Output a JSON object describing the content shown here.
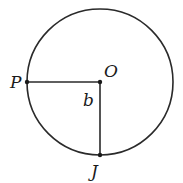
{
  "diagram": {
    "type": "geometry-circle",
    "circle": {
      "cx": 100,
      "cy": 82,
      "r": 73,
      "stroke": "#2a2a2a"
    },
    "points": [
      {
        "id": "O",
        "label": "O",
        "x": 100,
        "y": 82
      },
      {
        "id": "P",
        "label": "P",
        "x": 27,
        "y": 82
      },
      {
        "id": "J",
        "label": "J",
        "x": 100,
        "y": 155
      }
    ],
    "segments": [
      {
        "from": "P",
        "to": "O"
      },
      {
        "from": "O",
        "to": "J"
      }
    ],
    "angle_label": "b"
  }
}
